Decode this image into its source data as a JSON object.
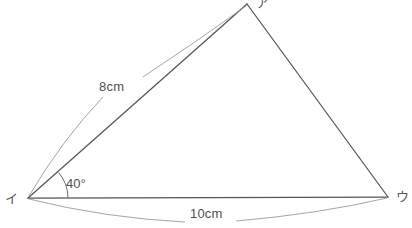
{
  "figure": {
    "type": "geometry-diagram",
    "background_color": "#ffffff",
    "line_color": "#555555",
    "measure_line_color": "#8d8d8d",
    "text_color": "#4f4f4f",
    "vertices": [
      {
        "id": "a",
        "label": "ア",
        "x": 247,
        "y": 4
      },
      {
        "id": "i",
        "label": "イ",
        "x": 28,
        "y": 198
      },
      {
        "id": "u",
        "label": "ウ",
        "x": 388,
        "y": 197
      }
    ],
    "sides": [
      {
        "from": "i",
        "to": "a",
        "measure": "8cm"
      },
      {
        "from": "i",
        "to": "u",
        "measure": "10cm"
      },
      {
        "from": "a",
        "to": "u",
        "measure": ""
      }
    ],
    "angles": [
      {
        "at": "i",
        "label": "40°",
        "value": 40,
        "unit": "degree",
        "arc_radius": 40
      }
    ],
    "measure_labels": {
      "side_8cm": "8cm",
      "side_10cm": "10cm",
      "angle_40": "40°"
    }
  }
}
